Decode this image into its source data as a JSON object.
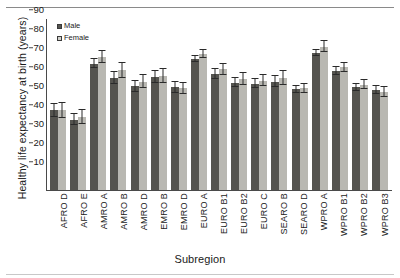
{
  "figure": {
    "xtitle": "Subregion",
    "ytitle": "Healthy life expectancy at birth (years)"
  },
  "legend": {
    "male_label": "Male",
    "female_label": "Female",
    "male_color": "#55544f",
    "female_color": "#b9b8b2"
  },
  "chart_data": {
    "type": "bar",
    "title": "",
    "xlabel": "Subregion",
    "ylabel": "Healthy life expectancy at birth (years)",
    "ylim": [
      0,
      90
    ],
    "yticks": [
      0,
      10,
      20,
      30,
      40,
      50,
      60,
      70,
      80,
      90
    ],
    "grid": false,
    "legend_position": "top-left",
    "error_bars": true,
    "categories": [
      "AFRO D",
      "AFRO E",
      "AMRO A",
      "AMRO B",
      "AMRO D",
      "EMRO B",
      "EMRO D",
      "EURO A",
      "EURO B1",
      "EURO B2",
      "EURO C",
      "SEARO B",
      "SEARO D",
      "WPRO A",
      "WPRO B1",
      "WPRO B2",
      "WPRO B3"
    ],
    "series": [
      {
        "name": "Male",
        "color": "#55544f",
        "values": [
          42.0,
          37.0,
          66.5,
          59.0,
          54.5,
          59.5,
          54.0,
          69.0,
          61.0,
          56.5,
          56.0,
          57.0,
          53.0,
          72.0,
          62.5,
          54.0,
          52.5
        ],
        "err_low": [
          3.5,
          3.0,
          2.5,
          3.0,
          3.0,
          3.0,
          3.0,
          1.5,
          2.5,
          2.5,
          2.5,
          3.0,
          2.0,
          1.5,
          2.0,
          2.0,
          2.0
        ],
        "err_high": [
          3.5,
          3.0,
          2.5,
          3.0,
          3.0,
          3.0,
          3.0,
          1.5,
          2.5,
          2.5,
          2.5,
          3.0,
          2.0,
          1.5,
          2.0,
          2.0,
          2.0
        ]
      },
      {
        "name": "Female",
        "color": "#b9b8b2",
        "values": [
          42.0,
          38.5,
          70.0,
          63.0,
          57.0,
          60.0,
          53.5,
          71.5,
          63.5,
          58.5,
          57.5,
          59.0,
          53.5,
          75.5,
          64.5,
          55.5,
          51.5
        ],
        "err_low": [
          4.0,
          3.5,
          3.0,
          4.0,
          3.5,
          3.5,
          3.0,
          2.0,
          3.0,
          3.0,
          3.0,
          3.5,
          2.5,
          3.0,
          2.5,
          2.5,
          2.5
        ],
        "err_high": [
          4.0,
          3.5,
          3.0,
          4.0,
          3.5,
          3.5,
          3.0,
          2.0,
          3.0,
          3.0,
          3.0,
          3.5,
          2.5,
          3.0,
          2.5,
          2.5,
          2.5
        ]
      }
    ]
  }
}
